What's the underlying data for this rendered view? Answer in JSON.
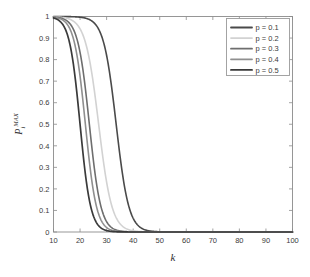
{
  "chart_data": {
    "type": "line",
    "title": "",
    "subtitle": "",
    "xlabel": "k",
    "ylabel": "P_i^{MAX}",
    "ylabel_base": "P",
    "ylabel_sub": "i",
    "ylabel_sup": "MAX",
    "xlim": [
      10,
      100
    ],
    "ylim": [
      0,
      1
    ],
    "xticks": [
      10,
      20,
      30,
      40,
      50,
      60,
      70,
      80,
      90,
      100
    ],
    "xtick_labels": [
      "10",
      "20",
      "30",
      "40",
      "50",
      "60",
      "70",
      "80",
      "90",
      "100"
    ],
    "yticks": [
      0,
      0.1,
      0.2,
      0.3,
      0.4,
      0.5,
      0.6,
      0.7,
      0.8,
      0.9,
      1
    ],
    "ytick_labels": [
      "0",
      "0.1",
      "0.2",
      "0.3",
      "0.4",
      "0.5",
      "0.6",
      "0.7",
      "0.8",
      "0.9",
      "1"
    ],
    "grid": false,
    "legend_position": "upper-right",
    "legend_entries": [
      "p = 0.1",
      "p = 0.2",
      "p = 0.3",
      "p = 0.4",
      "p = 0.5"
    ],
    "series": [
      {
        "name": "p = 0.1",
        "color": "#4a4a4a",
        "width": 1.6,
        "midpoint": 33.6,
        "steepness": 0.42,
        "x": [
          10,
          12,
          14,
          16,
          18,
          20,
          22,
          24,
          25,
          26,
          27,
          28,
          29,
          30,
          31,
          32,
          33,
          34,
          35,
          36,
          37,
          38,
          39,
          40,
          41,
          42,
          44,
          46,
          48,
          50,
          52,
          55,
          58,
          60,
          65,
          70,
          80,
          90,
          100
        ],
        "y": [
          1,
          1,
          1,
          1,
          1,
          1,
          0.999,
          0.998,
          0.996,
          0.993,
          0.987,
          0.976,
          0.957,
          0.925,
          0.873,
          0.797,
          0.695,
          0.574,
          0.448,
          0.329,
          0.228,
          0.151,
          0.096,
          0.059,
          0.036,
          0.021,
          0.007,
          0.003,
          0.001,
          0.0004,
          0.0002,
          0.0001,
          0,
          0,
          0,
          0,
          0,
          0,
          0
        ]
      },
      {
        "name": "p = 0.2",
        "color": "#d2d2d2",
        "width": 1.6,
        "midpoint": 27,
        "steepness": 0.4,
        "x": [
          10,
          12,
          14,
          16,
          18,
          19,
          20,
          21,
          22,
          23,
          24,
          25,
          26,
          27,
          28,
          29,
          30,
          31,
          32,
          33,
          34,
          35,
          36,
          38,
          40,
          42,
          45,
          48,
          50,
          55,
          60,
          70,
          80,
          90,
          100
        ],
        "y": [
          1,
          1,
          1,
          1,
          0.999,
          0.998,
          0.997,
          0.994,
          0.989,
          0.979,
          0.961,
          0.929,
          0.876,
          0.796,
          0.69,
          0.566,
          0.437,
          0.319,
          0.221,
          0.147,
          0.094,
          0.059,
          0.036,
          0.013,
          0.005,
          0.002,
          0.0005,
          0.0001,
          0.0001,
          0,
          0,
          0,
          0,
          0,
          0
        ]
      },
      {
        "name": "p = 0.3",
        "color": "#6e6e6e",
        "width": 1.6,
        "midpoint": 23.5,
        "steepness": 0.46,
        "x": [
          10,
          12,
          14,
          15,
          16,
          17,
          18,
          19,
          20,
          21,
          22,
          23,
          24,
          25,
          26,
          27,
          28,
          29,
          30,
          31,
          32,
          34,
          36,
          38,
          40,
          44,
          48,
          52,
          60,
          70,
          80,
          90,
          100
        ],
        "y": [
          1,
          1,
          0.999,
          0.999,
          0.998,
          0.996,
          0.992,
          0.985,
          0.971,
          0.944,
          0.898,
          0.825,
          0.722,
          0.595,
          0.46,
          0.334,
          0.228,
          0.148,
          0.092,
          0.056,
          0.033,
          0.011,
          0.004,
          0.001,
          0.0005,
          0.0001,
          0,
          0,
          0,
          0,
          0,
          0,
          0
        ]
      },
      {
        "name": "p = 0.4",
        "color": "#8f8f8f",
        "width": 1.6,
        "midpoint": 22,
        "steepness": 0.48,
        "x": [
          10,
          12,
          13,
          14,
          15,
          16,
          17,
          18,
          19,
          20,
          21,
          22,
          23,
          24,
          25,
          26,
          27,
          28,
          29,
          30,
          32,
          34,
          36,
          38,
          42,
          46,
          50,
          60,
          70,
          80,
          90,
          100
        ],
        "y": [
          1,
          0.999,
          0.999,
          0.998,
          0.997,
          0.994,
          0.989,
          0.978,
          0.958,
          0.922,
          0.863,
          0.777,
          0.664,
          0.533,
          0.4,
          0.281,
          0.187,
          0.118,
          0.072,
          0.042,
          0.014,
          0.005,
          0.002,
          0.0005,
          0.0001,
          0,
          0,
          0,
          0,
          0,
          0,
          0
        ]
      },
      {
        "name": "p = 0.5",
        "color": "#3a3a3a",
        "width": 1.7,
        "midpoint": 20,
        "steepness": 0.5,
        "x": [
          10,
          11,
          12,
          13,
          14,
          15,
          16,
          17,
          18,
          19,
          20,
          21,
          22,
          23,
          24,
          25,
          26,
          27,
          28,
          30,
          32,
          34,
          36,
          40,
          44,
          50,
          60,
          70,
          80,
          90,
          100
        ],
        "y": [
          0.999,
          0.999,
          0.998,
          0.997,
          0.994,
          0.988,
          0.977,
          0.956,
          0.916,
          0.85,
          0.752,
          0.624,
          0.483,
          0.348,
          0.234,
          0.15,
          0.092,
          0.055,
          0.032,
          0.011,
          0.004,
          0.001,
          0.0005,
          0.0001,
          0,
          0,
          0,
          0,
          0,
          0,
          0
        ]
      }
    ]
  },
  "axes": {
    "frame_color": "#8c8c8c",
    "background": "#ffffff"
  }
}
